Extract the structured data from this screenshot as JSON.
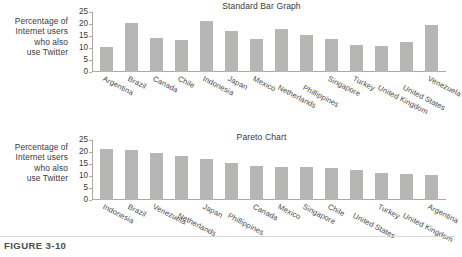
{
  "figure": {
    "caption": "FIGURE 3-10"
  },
  "shared": {
    "y_axis_caption_lines": [
      "Percentage of",
      "Internet users",
      "who also",
      "use Twitter"
    ],
    "y_ticks": [
      "0",
      "5",
      "10",
      "15",
      "20",
      "25"
    ]
  },
  "chart_data": [
    {
      "type": "bar",
      "title": "Standard Bar Graph",
      "xlabel": "",
      "ylabel": "Percentage of Internet users who also use Twitter",
      "ylim": [
        0,
        25
      ],
      "yticks": [
        0,
        5,
        10,
        15,
        20,
        25
      ],
      "grid": false,
      "legend": "none",
      "bar_color": "#b6b6b4",
      "categories": [
        "Argentina",
        "Brazil",
        "Canada",
        "Chile",
        "Indonesia",
        "Japan",
        "Mexico",
        "Netherlands",
        "Phillippines",
        "Singapore",
        "Turkey",
        "United Kingdom",
        "United States",
        "Venezuela"
      ],
      "values": [
        10.5,
        20.3,
        14.0,
        13.5,
        21.3,
        17.2,
        13.8,
        17.8,
        15.4,
        13.7,
        11.4,
        11.0,
        12.3,
        19.4
      ]
    },
    {
      "type": "bar",
      "title": "Pareto Chart",
      "xlabel": "",
      "ylabel": "Percentage of Internet users who also use Twitter",
      "ylim": [
        0,
        25
      ],
      "yticks": [
        0,
        5,
        10,
        15,
        20,
        25
      ],
      "grid": false,
      "legend": "none",
      "bar_color": "#b6b6b4",
      "categories": [
        "Indonesia",
        "Brazil",
        "Venezuela",
        "Netherlands",
        "Japan",
        "Phillippines",
        "Canada",
        "Mexico",
        "Singapore",
        "Chile",
        "United States",
        "Turkey",
        "United Kingdom",
        "Argentina"
      ],
      "values": [
        21.3,
        21.0,
        19.4,
        18.2,
        17.2,
        15.4,
        14.0,
        13.8,
        13.7,
        13.5,
        12.3,
        11.4,
        11.0,
        10.5
      ]
    }
  ]
}
